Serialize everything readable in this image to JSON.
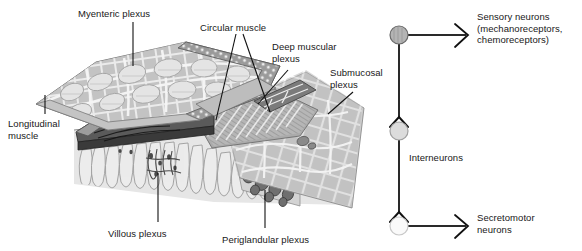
{
  "figure": {
    "background_color": "#ffffff",
    "text_color": "#181818"
  },
  "anatomy_panel": {
    "name": "gut-wall-cutaway-illustration",
    "labels": [
      {
        "id": "myenteric",
        "text": "Myenteric plexus",
        "x": 78,
        "y": 8
      },
      {
        "id": "circular",
        "text": "Circular muscle",
        "x": 200,
        "y": 22
      },
      {
        "id": "deep_muscular",
        "text": "Deep muscular\nplexus",
        "x": 272,
        "y": 41
      },
      {
        "id": "submucosal",
        "text": "Submucosal\nplexus",
        "x": 330,
        "y": 67
      },
      {
        "id": "longitudinal",
        "text": "Longitudinal\nmuscle",
        "x": 8,
        "y": 118
      },
      {
        "id": "villous",
        "text": "Villous plexus",
        "x": 108,
        "y": 228
      },
      {
        "id": "periglandular",
        "text": "Periglandular plexus",
        "x": 222,
        "y": 234
      }
    ],
    "colors": {
      "tissue_light": "#d8d8d8",
      "tissue_mid": "#aaaaaa",
      "tissue_dark": "#6e6e6e",
      "tissue_darkest": "#3c3c3c",
      "outline": "#4a4a4a",
      "leader_line": "#111111"
    }
  },
  "neuron_panel": {
    "name": "enteric-neuron-circuit-diagram",
    "nodes": [
      {
        "id": "sensory",
        "label": "Sensory neurons\n(mechanoreceptors,\nchemoreceptors)",
        "fill": "#b4b4b4",
        "stroke": "#6a6a6a",
        "cx": 399,
        "cy": 35,
        "r": 9
      },
      {
        "id": "inter",
        "label": "Interneurons",
        "fill": "#dcdcdc",
        "stroke": "#a0a0a0",
        "cx": 399,
        "cy": 131,
        "r": 9
      },
      {
        "id": "secreto",
        "label": "Secretomotor\nneurons",
        "fill": "#fafafa",
        "stroke": "#c8c8c8",
        "cx": 399,
        "cy": 226,
        "r": 9
      }
    ],
    "labels": [
      {
        "id": "sensory-label",
        "text": "Sensory neurons\n(mechanoreceptors,\nchemoreceptors)",
        "x": 477,
        "y": 11
      },
      {
        "id": "inter-label",
        "text": "Interneurons",
        "x": 409,
        "y": 152
      },
      {
        "id": "secreto-label",
        "text": "Secretomotor\nneurons",
        "x": 477,
        "y": 212
      }
    ],
    "colors": {
      "axon": "#2a2a2a",
      "arrow": "#111111"
    }
  }
}
